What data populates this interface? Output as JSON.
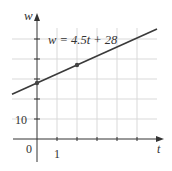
{
  "chart_data": {
    "type": "line",
    "title": "",
    "equation_label": "w = 4.5t + 28",
    "xlabel": "t",
    "ylabel": "w",
    "x_tick_labels": [
      {
        "value": 0,
        "label": "0"
      },
      {
        "value": 1,
        "label": "1"
      }
    ],
    "y_tick_labels": [
      {
        "value": 10,
        "label": "10"
      }
    ],
    "xlim": [
      -1.25,
      7
    ],
    "ylim": [
      -8,
      52
    ],
    "x_grid": [
      1,
      2,
      3,
      4,
      5
    ],
    "y_grid": [
      10,
      20,
      30,
      40,
      50
    ],
    "grid": true,
    "series": [
      {
        "name": "w = 4.5t + 28",
        "slope": 4.5,
        "intercept": 28,
        "x": [
          -1.25,
          6
        ],
        "values": [
          22.375,
          55
        ]
      }
    ],
    "points": [
      {
        "x": 0,
        "y": 28
      },
      {
        "x": 2,
        "y": 37
      }
    ],
    "colors": {
      "line": "#3a3a3a",
      "grid": "#d9d9d9",
      "axis": "#333333",
      "point": "#444444"
    }
  }
}
